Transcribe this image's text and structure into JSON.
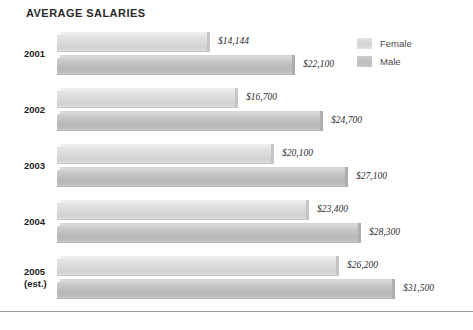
{
  "chart": {
    "title": "AVERAGE SALARIES"
  },
  "legend": {
    "position": "top-right",
    "items": [
      {
        "label": "Female",
        "key": "female",
        "color": "#d6d6d6"
      },
      {
        "label": "Male",
        "key": "male",
        "color": "#bcbcbc"
      }
    ]
  },
  "groups": [
    {
      "year": "2001",
      "year_sub": "",
      "female": {
        "value": 14144,
        "label": "$14,144"
      },
      "male": {
        "value": 22100,
        "label": "$22,100"
      }
    },
    {
      "year": "2002",
      "year_sub": "",
      "female": {
        "value": 16700,
        "label": "$16,700"
      },
      "male": {
        "value": 24700,
        "label": "$24,700"
      }
    },
    {
      "year": "2003",
      "year_sub": "",
      "female": {
        "value": 20100,
        "label": "$20,100"
      },
      "male": {
        "value": 27100,
        "label": "$27,100"
      }
    },
    {
      "year": "2004",
      "year_sub": "",
      "female": {
        "value": 23400,
        "label": "$23,400"
      },
      "male": {
        "value": 28300,
        "label": "$28,300"
      }
    },
    {
      "year": "2005",
      "year_sub": "(est.)",
      "female": {
        "value": 26200,
        "label": "$26,200"
      },
      "male": {
        "value": 31500,
        "label": "$31,500"
      }
    }
  ],
  "chart_data": {
    "type": "bar",
    "orientation": "horizontal",
    "title": "AVERAGE SALARIES",
    "xlabel": "",
    "ylabel": "",
    "categories": [
      "2001",
      "2002",
      "2003",
      "2004",
      "2005 (est.)"
    ],
    "series": [
      {
        "name": "Female",
        "values": [
          14144,
          16700,
          20100,
          23400,
          26200
        ],
        "labels": [
          "$14,144",
          "$16,700",
          "$20,100",
          "$23,400",
          "$26,200"
        ],
        "color": "#d6d6d6"
      },
      {
        "name": "Male",
        "values": [
          22100,
          24700,
          27100,
          28300,
          31500
        ],
        "labels": [
          "$22,100",
          "$24,700",
          "$27,100",
          "$28,300",
          "$31,500"
        ],
        "color": "#bcbcbc"
      }
    ],
    "xlim": [
      0,
      31500
    ],
    "grid": false,
    "legend_position": "top-right",
    "value_labels": true,
    "style": "3d-bevel-grayscale"
  },
  "layout": {
    "bar_origin_x": 57,
    "max_bar_px": 335,
    "max_value": 31500
  }
}
